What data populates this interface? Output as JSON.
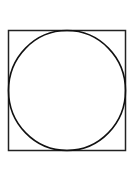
{
  "diagram": {
    "square": {
      "x": 8.5,
      "y": 30.5,
      "width": 117,
      "height": 120,
      "stroke": "#222222",
      "stroke_width": 1.5
    },
    "circle": {
      "cx": 67,
      "cy": 90.5,
      "rx": 58.5,
      "ry": 60,
      "stroke": "#111111",
      "stroke_width": 1.6
    }
  }
}
